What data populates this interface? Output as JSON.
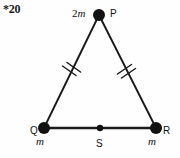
{
  "figure": {
    "problem_number": "*20",
    "type": "isosceles-triangle-point-mass-diagram",
    "stroke_color": "#1a1a1a",
    "background_color": "#fefefe",
    "vertices": [
      {
        "id": "P",
        "point_label": "P",
        "mass_label": "2m",
        "mass_prefix": "2",
        "mass_symbol": "m",
        "x": 99,
        "y": 15,
        "dot_radius": 6,
        "role": "apex"
      },
      {
        "id": "Q",
        "point_label": "Q",
        "mass_label": "m",
        "mass_prefix": "",
        "mass_symbol": "m",
        "x": 44,
        "y": 128,
        "dot_radius": 6,
        "role": "base-left"
      },
      {
        "id": "R",
        "point_label": "R",
        "mass_label": "m",
        "mass_prefix": "",
        "mass_symbol": "m",
        "x": 156,
        "y": 128,
        "dot_radius": 6,
        "role": "base-right"
      }
    ],
    "midpoint": {
      "id": "S",
      "point_label": "S",
      "x": 100,
      "y": 128,
      "dot_radius": 3.2,
      "role": "base-midpoint"
    },
    "edges": [
      {
        "id": "PQ",
        "from": "P",
        "to": "Q",
        "tick_marks": 2,
        "stroke_width": 1.9
      },
      {
        "id": "PR",
        "from": "P",
        "to": "R",
        "tick_marks": 2,
        "stroke_width": 1.9
      },
      {
        "id": "QR",
        "from": "Q",
        "to": "R",
        "tick_marks": 0,
        "stroke_width": 2.4
      }
    ],
    "tick_mark_note": "double hatch marks on PQ and PR indicate equal side lengths"
  }
}
